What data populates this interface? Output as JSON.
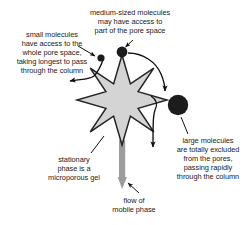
{
  "figure": {
    "background_color": "#ffffff"
  },
  "labels": {
    "small_molecules": "small molecules\nhave access to the\nwhole pore space,\ntaking longest to pass\nthrough the column",
    "medium_molecules": "medium-sized molecules\nmay have access to\npart of the pore space",
    "large_molecules": "large molecules\nare totally excluded\nfrom the pores,\npassing rapidly\nthrough the column",
    "stationary_phase": "stationary\nphase is a\nmicroporous gel",
    "mobile_phase": "flow of\nmobile phase"
  },
  "colors": {
    "gel_fill": "#d4d4d4",
    "gel_stroke": "#222222",
    "molecule_fill": "#1c1c1c",
    "mobile_phase_bar": "#9c9c9c",
    "text": "#1a1a1a",
    "arrow": "#111111"
  },
  "shapes": {
    "gel_star": {
      "name": "microporous-gel-star",
      "center_x": 122,
      "center_y": 100,
      "outer_radius": 45,
      "inner_radius": 22,
      "points": 8
    },
    "molecules": [
      {
        "name": "small-molecule",
        "cx": 101,
        "cy": 58,
        "r": 3.6
      },
      {
        "name": "medium-molecule",
        "cx": 122,
        "cy": 52,
        "r": 5.4
      },
      {
        "name": "large-molecule",
        "cx": 178,
        "cy": 105,
        "r": 10.2
      }
    ],
    "mobile_phase_bar": {
      "x": 119,
      "y_top": 140,
      "y_bottom": 176,
      "width": 6,
      "arrow_tip_y": 188
    }
  }
}
